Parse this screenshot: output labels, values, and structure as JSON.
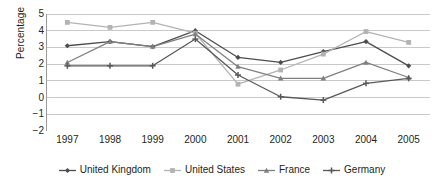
{
  "chart_data": {
    "type": "line",
    "title": "",
    "xlabel": "",
    "ylabel": "Percentage",
    "categories": [
      "1997",
      "1998",
      "1999",
      "2000",
      "2001",
      "2002",
      "2003",
      "2004",
      "2005"
    ],
    "x": [
      1997,
      1998,
      1999,
      2000,
      2001,
      2002,
      2003,
      2004,
      2005
    ],
    "ylim": [
      -2,
      5
    ],
    "yticks": [
      5,
      4,
      3,
      2,
      1,
      0,
      -1,
      -2
    ],
    "ytick_labels": [
      "5",
      "4",
      "3",
      "2",
      "1",
      "0",
      "−1",
      "−2"
    ],
    "grid": true,
    "legend_position": "bottom",
    "series": [
      {
        "name": "United Kingdom",
        "color": "#4d4d4d",
        "marker": "diamond",
        "values": [
          3.1,
          3.35,
          3.05,
          4.0,
          2.4,
          2.1,
          2.75,
          3.35,
          1.9
        ]
      },
      {
        "name": "United States",
        "color": "#b3b3b3",
        "marker": "square",
        "values": [
          4.5,
          4.2,
          4.5,
          3.85,
          0.8,
          1.65,
          2.6,
          3.95,
          3.3
        ]
      },
      {
        "name": "France",
        "color": "#808080",
        "marker": "triangle",
        "values": [
          2.1,
          3.35,
          3.05,
          3.8,
          1.85,
          1.15,
          1.15,
          2.1,
          1.2
        ]
      },
      {
        "name": "Germany",
        "color": "#595959",
        "marker": "cross",
        "values": [
          1.9,
          1.9,
          1.9,
          3.5,
          1.35,
          0.05,
          -0.15,
          0.85,
          1.15
        ]
      }
    ]
  }
}
